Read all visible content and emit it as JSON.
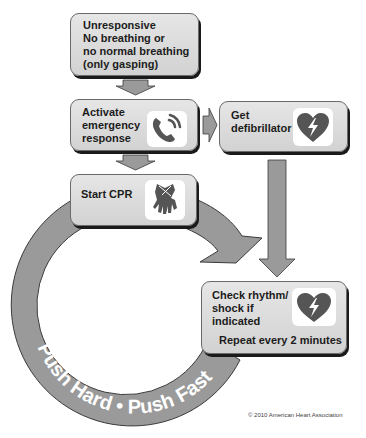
{
  "diagram": {
    "nodes": [
      {
        "id": "unresponsive",
        "label": "Unresponsive\nNo breathing or\nno normal breathing\n(only gasping)"
      },
      {
        "id": "activate",
        "label": "Activate\nemergency\nresponse",
        "icon": "phone-icon"
      },
      {
        "id": "defib",
        "label": "Get\ndefibrillator",
        "icon": "aed-heart-icon"
      },
      {
        "id": "cpr",
        "label": "Start CPR",
        "icon": "cpr-hands-icon"
      },
      {
        "id": "check",
        "label": "Check rhythm/\nshock if\nindicated",
        "icon": "aed-heart-icon",
        "sublabel": "Repeat every 2 minutes"
      }
    ],
    "edges": [
      {
        "from": "unresponsive",
        "to": "activate"
      },
      {
        "from": "activate",
        "to": "defib"
      },
      {
        "from": "activate",
        "to": "cpr"
      },
      {
        "from": "defib",
        "to": "check"
      },
      {
        "from": "cpr",
        "to": "check"
      }
    ],
    "cycle_label": "Push Hard • Push Fast",
    "copyright": "© 2010 American Heart Association"
  },
  "colors": {
    "arrow": "#9a9a9a",
    "box": "#dcdcdc",
    "icon": "#555555"
  }
}
